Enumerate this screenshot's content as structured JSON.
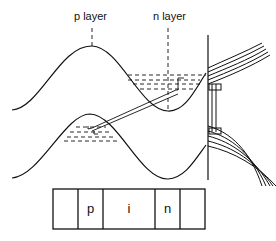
{
  "labels": {
    "p_layer": "p layer",
    "n_layer": "n layer"
  },
  "layer_strip": {
    "cells": [
      "",
      "p",
      "i",
      "n",
      ""
    ]
  },
  "colors": {
    "ink": "#111111",
    "background": "#ffffff"
  }
}
